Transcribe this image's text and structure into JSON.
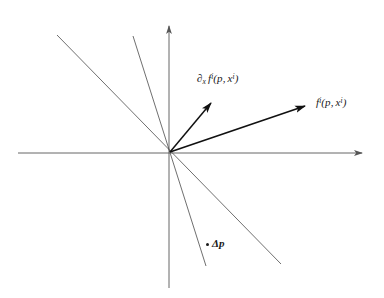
{
  "figure": {
    "kind": "vector-diagram",
    "width": 384,
    "height": 298,
    "background_color": "#ffffff",
    "line_color": "#4a4a4a",
    "axis_color": "#555555",
    "vector_color": "#111111",
    "text_color": "#1a1a1a"
  },
  "labels": {
    "derivative_vector": {
      "full_text": "∂x f i(p, x i)",
      "operator": "∂",
      "operator_subscript": "x",
      "function": "f",
      "function_superscript": "i",
      "open_paren": "(",
      "arg1": "p",
      "comma": ",",
      "arg2": "x",
      "arg2_superscript": "i",
      "close_paren": ")"
    },
    "function_vector": {
      "full_text": "f i(p, x i)",
      "function": "f",
      "function_superscript": "i",
      "open_paren": "(",
      "arg1": "p",
      "comma": ",",
      "arg2": "x",
      "arg2_superscript": "i",
      "close_paren": ")"
    },
    "delta_point": {
      "full_text": "Δp",
      "delta": "Δ",
      "variable": "p"
    }
  },
  "geometry": {
    "origin": {
      "x": 170,
      "y": 152
    },
    "axes": {
      "horizontal": {
        "x1": 18,
        "y1": 153,
        "x2": 370,
        "y2": 153,
        "arrow_end": "right"
      },
      "vertical": {
        "x1": 169,
        "y1": 288,
        "x2": 169,
        "y2": 18,
        "arrow_end": "top"
      }
    },
    "thin_lines": [
      {
        "name": "line-shallow",
        "x1": 57,
        "y1": 35,
        "x2": 281,
        "y2": 264
      },
      {
        "name": "line-steep",
        "x1": 133,
        "y1": 36,
        "x2": 206,
        "y2": 266
      }
    ],
    "vectors": [
      {
        "name": "derivative-vector",
        "x1": 170,
        "y1": 152,
        "x2": 215,
        "y2": 98
      },
      {
        "name": "function-vector",
        "x1": 170,
        "y1": 152,
        "x2": 312,
        "y2": 104
      }
    ],
    "delta_point_marker": {
      "x": 207,
      "y": 244,
      "radius": 1.6
    }
  }
}
